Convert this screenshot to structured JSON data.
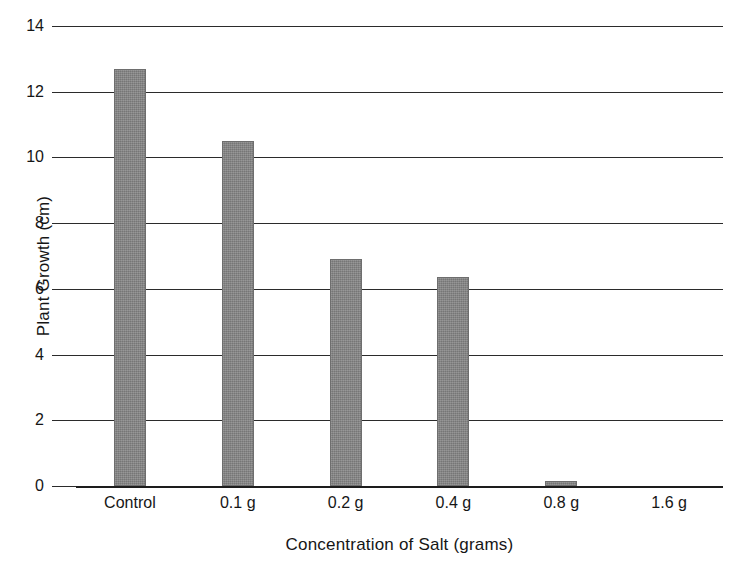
{
  "chart_data": {
    "type": "bar",
    "title": "",
    "categories": [
      "Control",
      "0.1 g",
      "0.2 g",
      "0.4 g",
      "0.8 g",
      "1.6 g"
    ],
    "values": [
      12.7,
      10.5,
      6.9,
      6.35,
      0.15,
      0
    ],
    "xlabel": "Concentration of Salt (grams)",
    "ylabel": "Plant Growth (cm)",
    "ylim": [
      0,
      14
    ],
    "yticks": [
      0,
      2,
      4,
      6,
      8,
      10,
      12,
      14
    ],
    "ytick_labels": [
      "0",
      "2",
      "4",
      "6",
      "8",
      "10",
      "12",
      "14"
    ],
    "grid": "horizontal",
    "legend": "none",
    "bar_color": "#848484",
    "axis_color": "#2b2b2b",
    "background_color": "#ffffff"
  }
}
